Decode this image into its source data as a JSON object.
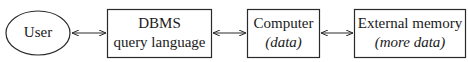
{
  "diagram": {
    "nodes": [
      {
        "id": "user",
        "shape": "ellipse",
        "line1": "User",
        "line2": ""
      },
      {
        "id": "dbms",
        "shape": "box",
        "line1": "DBMS",
        "line2": "query language"
      },
      {
        "id": "computer",
        "shape": "box",
        "line1": "Computer",
        "line2": "(data)"
      },
      {
        "id": "external",
        "shape": "box",
        "line1": "External memory",
        "line2": "(more data)"
      }
    ],
    "edges": [
      {
        "from": "user",
        "to": "dbms",
        "type": "bidirectional"
      },
      {
        "from": "dbms",
        "to": "computer",
        "type": "bidirectional"
      },
      {
        "from": "computer",
        "to": "external",
        "type": "bidirectional"
      }
    ],
    "colors": {
      "stroke": "#2a2a2a",
      "background": "#ffffff",
      "text": "#1a1a1a"
    }
  }
}
